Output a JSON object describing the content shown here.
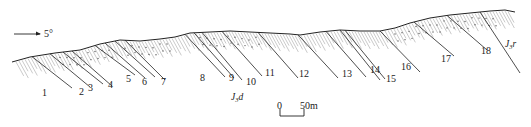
{
  "diagram": {
    "type": "geological-cross-section",
    "orientation": {
      "arrow_icon": "right-arrow-icon",
      "label": "5°"
    },
    "layers": [
      "1",
      "2",
      "3",
      "4",
      "5",
      "6",
      "7",
      "8",
      "9",
      "10",
      "11",
      "12",
      "13",
      "14",
      "15",
      "16",
      "17",
      "18"
    ],
    "formations": [
      {
        "base": "J",
        "subscript": "3",
        "suffix": "d"
      },
      {
        "base": "J",
        "subscript": "3",
        "suffix": "r"
      }
    ],
    "scale_bar": {
      "start_label": "0",
      "end_label": "50m"
    },
    "colors": {
      "ink": "#222222",
      "hatch": "#666666",
      "background": "#ffffff"
    }
  }
}
